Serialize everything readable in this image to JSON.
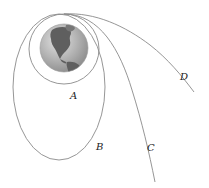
{
  "diagram": {
    "type": "orbital-trajectories",
    "central_body": {
      "name": "Earth",
      "icon": "globe-icon"
    },
    "labels": {
      "A": "A",
      "B": "B",
      "C": "C",
      "D": "D"
    },
    "trajectories": [
      {
        "id": "A",
        "shape": "circle"
      },
      {
        "id": "B",
        "shape": "ellipse"
      },
      {
        "id": "C",
        "shape": "open-curve"
      },
      {
        "id": "D",
        "shape": "open-curve"
      }
    ],
    "colors": {
      "line": "#8a8a8a",
      "ocean": "#a9a9a9",
      "land": "#5e5e5e",
      "label": "#222222"
    }
  }
}
